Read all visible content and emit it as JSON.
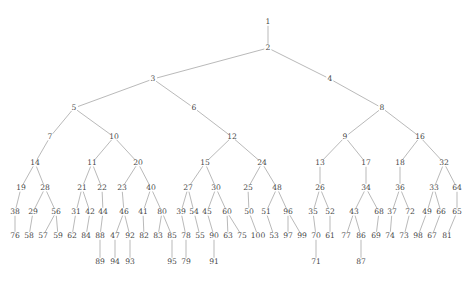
{
  "figure": {
    "kind": "rooted-binary-tree-diagram",
    "node_count": 100,
    "depth_levels": 7,
    "colors": {
      "background": "#ffffff",
      "edge": "#8a8a8a",
      "label": "#4a4a4a"
    },
    "edge_width": 0.6
  },
  "chart_data": {
    "type": "diagram",
    "title": "",
    "xlabel": "",
    "ylabel": "",
    "nodes": [
      {
        "label": "1",
        "x": 268,
        "y": 22
      },
      {
        "label": "2",
        "x": 268,
        "y": 48
      },
      {
        "label": "3",
        "x": 153,
        "y": 79
      },
      {
        "label": "4",
        "x": 330,
        "y": 79
      },
      {
        "label": "5",
        "x": 74,
        "y": 108
      },
      {
        "label": "6",
        "x": 194,
        "y": 108
      },
      {
        "label": "8",
        "x": 382,
        "y": 108
      },
      {
        "label": "7",
        "x": 50,
        "y": 137
      },
      {
        "label": "10",
        "x": 114,
        "y": 137
      },
      {
        "label": "12",
        "x": 232,
        "y": 137
      },
      {
        "label": "9",
        "x": 345,
        "y": 137
      },
      {
        "label": "16",
        "x": 420,
        "y": 137
      },
      {
        "label": "14",
        "x": 35,
        "y": 163
      },
      {
        "label": "11",
        "x": 92,
        "y": 163
      },
      {
        "label": "20",
        "x": 138,
        "y": 163
      },
      {
        "label": "15",
        "x": 205,
        "y": 163
      },
      {
        "label": "24",
        "x": 262,
        "y": 163
      },
      {
        "label": "13",
        "x": 320,
        "y": 163
      },
      {
        "label": "17",
        "x": 366,
        "y": 163
      },
      {
        "label": "18",
        "x": 400,
        "y": 163
      },
      {
        "label": "32",
        "x": 444,
        "y": 163
      },
      {
        "label": "19",
        "x": 21,
        "y": 188
      },
      {
        "label": "28",
        "x": 45,
        "y": 188
      },
      {
        "label": "21",
        "x": 82,
        "y": 188
      },
      {
        "label": "22",
        "x": 102,
        "y": 188
      },
      {
        "label": "23",
        "x": 122,
        "y": 188
      },
      {
        "label": "40",
        "x": 151,
        "y": 188
      },
      {
        "label": "27",
        "x": 188,
        "y": 188
      },
      {
        "label": "30",
        "x": 216,
        "y": 188
      },
      {
        "label": "25",
        "x": 248,
        "y": 188
      },
      {
        "label": "48",
        "x": 277,
        "y": 188
      },
      {
        "label": "26",
        "x": 320,
        "y": 188
      },
      {
        "label": "34",
        "x": 366,
        "y": 188
      },
      {
        "label": "36",
        "x": 400,
        "y": 188
      },
      {
        "label": "33",
        "x": 434,
        "y": 188
      },
      {
        "label": "64",
        "x": 457,
        "y": 188
      },
      {
        "label": "38",
        "x": 15,
        "y": 212
      },
      {
        "label": "29",
        "x": 33,
        "y": 212
      },
      {
        "label": "56",
        "x": 56,
        "y": 212
      },
      {
        "label": "31",
        "x": 76,
        "y": 212
      },
      {
        "label": "42",
        "x": 90,
        "y": 212
      },
      {
        "label": "44",
        "x": 103,
        "y": 212
      },
      {
        "label": "46",
        "x": 124,
        "y": 212
      },
      {
        "label": "41",
        "x": 143,
        "y": 212
      },
      {
        "label": "80",
        "x": 162,
        "y": 212
      },
      {
        "label": "39",
        "x": 181,
        "y": 212
      },
      {
        "label": "54",
        "x": 194,
        "y": 212
      },
      {
        "label": "45",
        "x": 207,
        "y": 212
      },
      {
        "label": "60",
        "x": 227,
        "y": 212
      },
      {
        "label": "50",
        "x": 249,
        "y": 212
      },
      {
        "label": "51",
        "x": 266,
        "y": 212
      },
      {
        "label": "96",
        "x": 288,
        "y": 212
      },
      {
        "label": "35",
        "x": 313,
        "y": 212
      },
      {
        "label": "52",
        "x": 330,
        "y": 212
      },
      {
        "label": "43",
        "x": 354,
        "y": 212
      },
      {
        "label": "68",
        "x": 379,
        "y": 212
      },
      {
        "label": "37",
        "x": 392,
        "y": 212
      },
      {
        "label": "72",
        "x": 410,
        "y": 212
      },
      {
        "label": "49",
        "x": 427,
        "y": 212
      },
      {
        "label": "66",
        "x": 441,
        "y": 212
      },
      {
        "label": "65",
        "x": 457,
        "y": 212
      },
      {
        "label": "76",
        "x": 15,
        "y": 236
      },
      {
        "label": "58",
        "x": 29,
        "y": 236
      },
      {
        "label": "57",
        "x": 43,
        "y": 236
      },
      {
        "label": "59",
        "x": 58,
        "y": 236
      },
      {
        "label": "62",
        "x": 72,
        "y": 236
      },
      {
        "label": "84",
        "x": 86,
        "y": 236
      },
      {
        "label": "88",
        "x": 100,
        "y": 236
      },
      {
        "label": "47",
        "x": 115,
        "y": 236
      },
      {
        "label": "92",
        "x": 130,
        "y": 236
      },
      {
        "label": "82",
        "x": 144,
        "y": 236
      },
      {
        "label": "83",
        "x": 158,
        "y": 236
      },
      {
        "label": "85",
        "x": 172,
        "y": 236
      },
      {
        "label": "78",
        "x": 186,
        "y": 236
      },
      {
        "label": "55",
        "x": 200,
        "y": 236
      },
      {
        "label": "90",
        "x": 214,
        "y": 236
      },
      {
        "label": "63",
        "x": 228,
        "y": 236
      },
      {
        "label": "75",
        "x": 242,
        "y": 236
      },
      {
        "label": "100",
        "x": 258,
        "y": 236
      },
      {
        "label": "53",
        "x": 274,
        "y": 236
      },
      {
        "label": "97",
        "x": 288,
        "y": 236
      },
      {
        "label": "99",
        "x": 302,
        "y": 236
      },
      {
        "label": "70",
        "x": 316,
        "y": 236
      },
      {
        "label": "61",
        "x": 330,
        "y": 236
      },
      {
        "label": "77",
        "x": 346,
        "y": 236
      },
      {
        "label": "86",
        "x": 361,
        "y": 236
      },
      {
        "label": "69",
        "x": 376,
        "y": 236
      },
      {
        "label": "74",
        "x": 390,
        "y": 236
      },
      {
        "label": "73",
        "x": 404,
        "y": 236
      },
      {
        "label": "98",
        "x": 418,
        "y": 236
      },
      {
        "label": "67",
        "x": 432,
        "y": 236
      },
      {
        "label": "81",
        "x": 447,
        "y": 236
      },
      {
        "label": "89",
        "x": 100,
        "y": 262
      },
      {
        "label": "94",
        "x": 115,
        "y": 262
      },
      {
        "label": "93",
        "x": 130,
        "y": 262
      },
      {
        "label": "95",
        "x": 172,
        "y": 262
      },
      {
        "label": "79",
        "x": 186,
        "y": 262
      },
      {
        "label": "91",
        "x": 214,
        "y": 262
      },
      {
        "label": "71",
        "x": 316,
        "y": 262
      },
      {
        "label": "87",
        "x": 361,
        "y": 262
      }
    ],
    "edges": [
      [
        "1",
        "2"
      ],
      [
        "2",
        "3"
      ],
      [
        "2",
        "4"
      ],
      [
        "3",
        "5"
      ],
      [
        "3",
        "6"
      ],
      [
        "4",
        "8"
      ],
      [
        "5",
        "7"
      ],
      [
        "5",
        "10"
      ],
      [
        "6",
        "12"
      ],
      [
        "8",
        "9"
      ],
      [
        "8",
        "16"
      ],
      [
        "7",
        "14"
      ],
      [
        "10",
        "11"
      ],
      [
        "10",
        "20"
      ],
      [
        "12",
        "15"
      ],
      [
        "12",
        "24"
      ],
      [
        "9",
        "13"
      ],
      [
        "9",
        "17"
      ],
      [
        "16",
        "18"
      ],
      [
        "16",
        "32"
      ],
      [
        "14",
        "19"
      ],
      [
        "14",
        "28"
      ],
      [
        "11",
        "21"
      ],
      [
        "11",
        "22"
      ],
      [
        "20",
        "23"
      ],
      [
        "20",
        "40"
      ],
      [
        "15",
        "27"
      ],
      [
        "15",
        "30"
      ],
      [
        "24",
        "25"
      ],
      [
        "24",
        "48"
      ],
      [
        "13",
        "26"
      ],
      [
        "17",
        "34"
      ],
      [
        "18",
        "36"
      ],
      [
        "32",
        "33"
      ],
      [
        "32",
        "64"
      ],
      [
        "19",
        "38"
      ],
      [
        "28",
        "29"
      ],
      [
        "28",
        "56"
      ],
      [
        "21",
        "31"
      ],
      [
        "21",
        "42"
      ],
      [
        "22",
        "44"
      ],
      [
        "23",
        "46"
      ],
      [
        "40",
        "41"
      ],
      [
        "40",
        "80"
      ],
      [
        "27",
        "39"
      ],
      [
        "27",
        "54"
      ],
      [
        "30",
        "45"
      ],
      [
        "30",
        "60"
      ],
      [
        "25",
        "50"
      ],
      [
        "48",
        "51"
      ],
      [
        "48",
        "96"
      ],
      [
        "26",
        "35"
      ],
      [
        "26",
        "52"
      ],
      [
        "34",
        "43"
      ],
      [
        "34",
        "68"
      ],
      [
        "36",
        "37"
      ],
      [
        "36",
        "72"
      ],
      [
        "33",
        "49"
      ],
      [
        "33",
        "66"
      ],
      [
        "64",
        "65"
      ],
      [
        "38",
        "76"
      ],
      [
        "29",
        "58"
      ],
      [
        "56",
        "57"
      ],
      [
        "56",
        "59"
      ],
      [
        "31",
        "62"
      ],
      [
        "42",
        "84"
      ],
      [
        "44",
        "88"
      ],
      [
        "46",
        "47"
      ],
      [
        "46",
        "92"
      ],
      [
        "41",
        "82"
      ],
      [
        "80",
        "83"
      ],
      [
        "80",
        "85"
      ],
      [
        "39",
        "78"
      ],
      [
        "54",
        "55"
      ],
      [
        "45",
        "90"
      ],
      [
        "60",
        "63"
      ],
      [
        "60",
        "75"
      ],
      [
        "50",
        "100"
      ],
      [
        "51",
        "53"
      ],
      [
        "96",
        "97"
      ],
      [
        "96",
        "99"
      ],
      [
        "35",
        "70"
      ],
      [
        "52",
        "61"
      ],
      [
        "43",
        "77"
      ],
      [
        "43",
        "86"
      ],
      [
        "68",
        "69"
      ],
      [
        "37",
        "74"
      ],
      [
        "72",
        "73"
      ],
      [
        "49",
        "98"
      ],
      [
        "66",
        "67"
      ],
      [
        "65",
        "81"
      ],
      [
        "88",
        "89"
      ],
      [
        "47",
        "94"
      ],
      [
        "92",
        "93"
      ],
      [
        "85",
        "95"
      ],
      [
        "78",
        "79"
      ],
      [
        "90",
        "91"
      ],
      [
        "70",
        "71"
      ],
      [
        "86",
        "87"
      ]
    ]
  }
}
